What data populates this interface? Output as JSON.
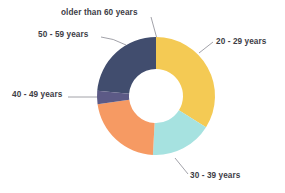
{
  "chart_data": {
    "type": "pie",
    "variant": "donut",
    "title": "",
    "xlabel": "",
    "ylabel": "",
    "legend_position": "callout-labels",
    "grid": false,
    "background": "#ffffff",
    "label_color": "#3d3d46",
    "leader_line_color": "#8a8a93",
    "center": {
      "x": 156,
      "y": 96
    },
    "outer_radius": 59,
    "inner_radius": 27,
    "start_angle_deg": -85,
    "categories": [
      "20 - 29 years",
      "30 - 39 years",
      "40 - 49 years",
      "50 - 59 years",
      "older than 60 years"
    ],
    "values": [
      24,
      34,
      17,
      22,
      3
    ],
    "colors": [
      "#414d6e",
      "#f4ca54",
      "#a6e2e0",
      "#f69a63",
      "#5c5a86"
    ],
    "slices": [
      {
        "label": "20 - 29 years",
        "value": 24,
        "color": "#414d6e",
        "start_deg": -85,
        "end_deg": 0
      },
      {
        "label": "30 - 39 years",
        "value": 34,
        "color": "#f4ca54",
        "start_deg": 0,
        "end_deg": 122
      },
      {
        "label": "40 - 49 years",
        "value": 17,
        "color": "#a6e2e0",
        "start_deg": 122,
        "end_deg": 183
      },
      {
        "label": "50 - 59 years",
        "value": 22,
        "color": "#f69a63",
        "start_deg": 183,
        "end_deg": 262
      },
      {
        "label": "older than 60 years",
        "value": 3,
        "color": "#5c5a86",
        "start_deg": 262,
        "end_deg": 275
      }
    ]
  },
  "labels": {
    "older_than_60": "older than 60 years",
    "fifty_to_fiftynine": "50 - 59 years",
    "forty_to_fortynine": "40 - 49 years",
    "twenty_to_twentynine": "20 - 29 years",
    "thirty_to_thirtynine": "30 - 39 years"
  }
}
